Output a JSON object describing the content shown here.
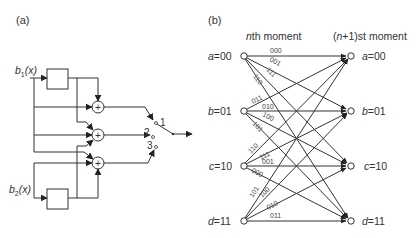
{
  "figure": {
    "panel_a": {
      "label": "(a)",
      "inputs": [
        {
          "name": "b",
          "subscript": "1",
          "arg": "(x)"
        },
        {
          "name": "b",
          "subscript": "2",
          "arg": "(x)"
        }
      ],
      "adder_symbol": "+",
      "switch_positions": [
        "1",
        "2",
        "3"
      ]
    },
    "panel_b": {
      "label": "(b)",
      "left_header_italic": "n",
      "left_header_rest": "th moment",
      "right_header_open": "(",
      "right_header_italic": "n",
      "right_header_rest": "+1)st moment",
      "states": [
        {
          "var": "a",
          "value": "=00"
        },
        {
          "var": "b",
          "value": "=01"
        },
        {
          "var": "c",
          "value": "=10"
        },
        {
          "var": "d",
          "value": "=11"
        }
      ],
      "edges": [
        {
          "from": "a",
          "to": "a",
          "label": "000"
        },
        {
          "from": "a",
          "to": "b",
          "label": "001"
        },
        {
          "from": "a",
          "to": "c",
          "label": "111"
        },
        {
          "from": "a",
          "to": "d",
          "label": "110"
        },
        {
          "from": "b",
          "to": "a",
          "label": "011"
        },
        {
          "from": "b",
          "to": "b",
          "label": "010"
        },
        {
          "from": "b",
          "to": "c",
          "label": "100"
        },
        {
          "from": "b",
          "to": "d",
          "label": "101"
        },
        {
          "from": "c",
          "to": "a",
          "label": "110"
        },
        {
          "from": "c",
          "to": "b",
          "label": "111"
        },
        {
          "from": "c",
          "to": "c",
          "label": "001"
        },
        {
          "from": "c",
          "to": "d",
          "label": "000"
        },
        {
          "from": "d",
          "to": "a",
          "label": "101"
        },
        {
          "from": "d",
          "to": "b",
          "label": "100"
        },
        {
          "from": "d",
          "to": "c",
          "label": "010"
        },
        {
          "from": "d",
          "to": "d",
          "label": "011"
        }
      ]
    }
  }
}
